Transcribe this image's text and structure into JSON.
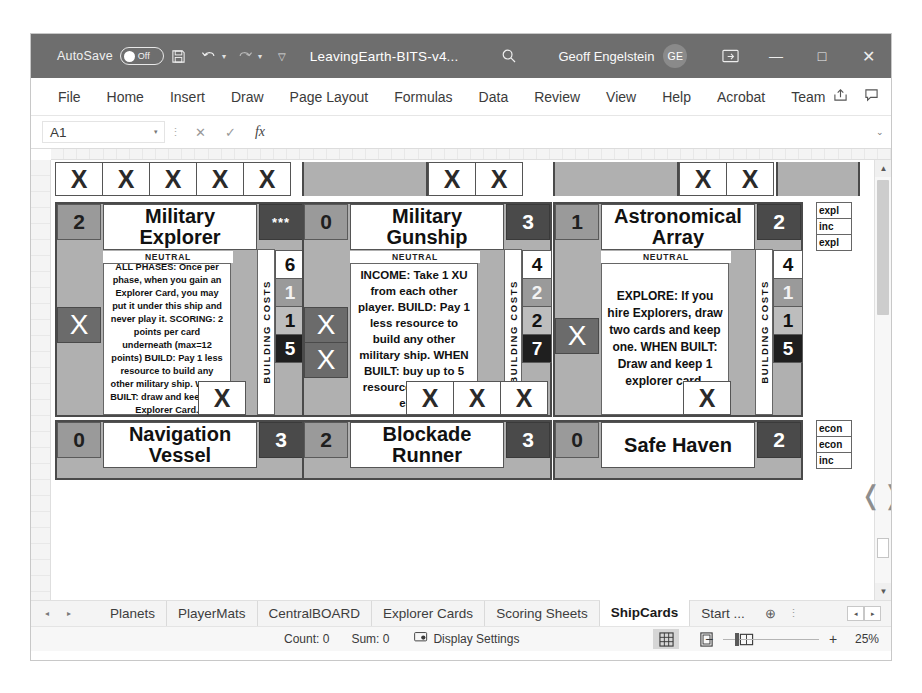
{
  "titlebar": {
    "autosave_label": "AutoSave",
    "autosave_state": "Off",
    "save_icon": "save-icon",
    "undo_icon": "undo-icon",
    "redo_icon": "redo-icon",
    "customize_icon": "customize-quick-access-icon",
    "document_title": "LeavingEarth-BITS-v4...",
    "search_icon": "search-icon",
    "user_name": "Geoff Engelstein",
    "user_initials": "GE",
    "ribbon_display_icon": "ribbon-display-options-icon",
    "minimize": "—",
    "maximize": "□",
    "close": "✕"
  },
  "ribbon": {
    "tabs": [
      "File",
      "Home",
      "Insert",
      "Draw",
      "Page Layout",
      "Formulas",
      "Data",
      "Review",
      "View",
      "Help",
      "Acrobat",
      "Team"
    ],
    "share_icon": "share-icon",
    "comments_icon": "comments-icon"
  },
  "formulabar": {
    "namebox_value": "A1",
    "namebox_caret": "▾",
    "cancel_icon": "✕",
    "enter_icon": "✓",
    "function_icon": "fx",
    "formula_value": "",
    "expand_icon": "⌄"
  },
  "grid": {
    "top_x_row": [
      "X",
      "X",
      "X",
      "X",
      "X",
      "",
      "",
      "X",
      "X",
      "",
      "",
      "X",
      "X",
      ""
    ],
    "mid_x_row_left": [
      "X"
    ],
    "mid_x_row_center": [
      "X",
      "X",
      "X"
    ],
    "mid_x_row_right": [
      "X"
    ],
    "right_labels_top": [
      "expl",
      "inc",
      "expl"
    ],
    "right_labels_bottom": [
      "econ",
      "econ",
      "inc"
    ]
  },
  "cards": {
    "building_costs_label": "BUILDING COSTS",
    "row1": [
      {
        "cost_left": "2",
        "title": "Military Explorer",
        "cost_right": "***",
        "cost_right_style": "stars",
        "faction": "NEUTRAL",
        "x_marks": 1,
        "text": "ALL PHASES: Once per phase, when you gain an Explorer Card, you may put it under this ship and never play it. SCORING: 2 points per card underneath (max=12 points) BUILD: Pay 1 less resource to build any other military ship. WHEN BUILT: draw and keep one Explorer Card.",
        "build_costs": [
          "6",
          "1",
          "1",
          "5"
        ],
        "build_cost_styles": [
          "w",
          "lg",
          "mg",
          "dk"
        ]
      },
      {
        "cost_left": "0",
        "title": "Military Gunship",
        "cost_right": "3",
        "cost_right_style": "num",
        "faction": "NEUTRAL",
        "x_marks": 2,
        "text": "INCOME: Take 1 XU from each other player. BUILD: Pay 1 less resource to build any other military ship. WHEN BUILT: buy up to 5 resources for 2 XU each.",
        "build_costs": [
          "4",
          "2",
          "2",
          "7"
        ],
        "build_cost_styles": [
          "w",
          "lg",
          "mg",
          "dk"
        ]
      },
      {
        "cost_left": "1",
        "title": "Astronomical Array",
        "cost_right": "2",
        "cost_right_style": "num",
        "faction": "NEUTRAL",
        "x_marks": 1,
        "text": "EXPLORE: If you hire Explorers, draw two cards and keep one. WHEN BUILT: Draw and keep 1 explorer card.",
        "build_costs": [
          "4",
          "1",
          "1",
          "5"
        ],
        "build_cost_styles": [
          "w",
          "lg",
          "mg",
          "dk"
        ]
      }
    ],
    "row2": [
      {
        "cost_left": "0",
        "title": "Navigation Vessel",
        "cost_right": "3"
      },
      {
        "cost_left": "2",
        "title": "Blockade Runner",
        "cost_right": "3"
      },
      {
        "cost_left": "0",
        "title": "Safe Haven",
        "cost_right": "2"
      }
    ]
  },
  "sheettabs": {
    "prev_icon": "◂",
    "next_icon": "▸",
    "tabs": [
      {
        "label": "Planets",
        "active": false
      },
      {
        "label": "PlayerMats",
        "active": false
      },
      {
        "label": "CentralBOARD",
        "active": false
      },
      {
        "label": "Explorer Cards",
        "active": false
      },
      {
        "label": "Scoring Sheets",
        "active": false
      },
      {
        "label": "ShipCards",
        "active": true
      },
      {
        "label": "Start ...",
        "active": false
      }
    ],
    "add_sheet_icon": "⊕",
    "more_icon": "⋮",
    "scroll_left": "◂",
    "scroll_right": "▸"
  },
  "statusbar": {
    "count_label": "Count: 0",
    "sum_label": "Sum: 0",
    "display_settings_label": "Display Settings",
    "display_settings_icon": "display-settings-icon",
    "view_normal_icon": "normal-view-icon",
    "view_pagelayout_icon": "page-layout-view-icon",
    "view_pagebreak_icon": "page-break-view-icon",
    "zoom_out": "−",
    "zoom_in": "+",
    "zoom_value": "25%"
  }
}
